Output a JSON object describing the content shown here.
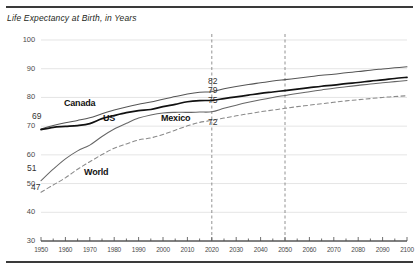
{
  "chart_data": {
    "type": "line",
    "title": "Life Expectancy at Birth, in Years",
    "xlabel": "",
    "ylabel": "",
    "xlim": [
      1950,
      2100
    ],
    "ylim": [
      30,
      100
    ],
    "ytick_step": 10,
    "xtick_step": 10,
    "xminor_step": 5,
    "grid": "horizontal",
    "legend": "inline-labels",
    "xticks": [
      "1950",
      "1960",
      "1970",
      "1980",
      "1990",
      "2000",
      "2010",
      "2020",
      "2030",
      "2040",
      "2050",
      "2060",
      "2070",
      "2080",
      "2090",
      "2100"
    ],
    "yticks": [
      "30",
      "40",
      "50",
      "60",
      "70",
      "80",
      "90",
      "100"
    ],
    "reference_lines": [
      {
        "name": "year-2020-marker",
        "x": 2020,
        "style": "dashed"
      },
      {
        "name": "year-2050-marker",
        "x": 2050,
        "style": "dashed"
      }
    ],
    "x": [
      1950,
      1955,
      1960,
      1965,
      1970,
      1975,
      1980,
      1985,
      1990,
      1995,
      2000,
      2005,
      2010,
      2015,
      2020,
      2025,
      2030,
      2035,
      2040,
      2045,
      2050,
      2055,
      2060,
      2065,
      2070,
      2075,
      2080,
      2085,
      2090,
      2095,
      2100
    ],
    "series": [
      {
        "name": "Canada",
        "color": "#555555",
        "style": "solid",
        "values": [
          69.0,
          70.2,
          71.2,
          72.0,
          72.9,
          74.3,
          75.6,
          76.7,
          77.6,
          78.4,
          79.4,
          80.3,
          81.2,
          81.8,
          82.0,
          83.0,
          83.8,
          84.5,
          85.1,
          85.7,
          86.2,
          86.7,
          87.2,
          87.7,
          88.1,
          88.6,
          89.0,
          89.5,
          89.9,
          90.3,
          90.7
        ]
      },
      {
        "name": "US",
        "color": "#111111",
        "style": "solid",
        "values": [
          68.8,
          69.6,
          69.9,
          70.2,
          70.9,
          72.6,
          73.7,
          74.7,
          75.4,
          75.8,
          76.8,
          77.6,
          78.5,
          78.9,
          79.0,
          79.6,
          80.2,
          80.8,
          81.4,
          81.9,
          82.4,
          82.9,
          83.4,
          83.9,
          84.3,
          84.8,
          85.2,
          85.7,
          86.1,
          86.6,
          87.0
        ]
      },
      {
        "name": "Mexico",
        "color": "#666666",
        "style": "solid",
        "values": [
          51.0,
          55.0,
          58.6,
          61.4,
          63.4,
          66.4,
          69.0,
          71.0,
          72.8,
          73.9,
          74.6,
          74.8,
          74.8,
          74.9,
          75.0,
          76.2,
          77.3,
          78.3,
          79.2,
          80.0,
          80.7,
          81.4,
          82.0,
          82.6,
          83.2,
          83.7,
          84.2,
          84.7,
          85.1,
          85.5,
          85.9
        ]
      },
      {
        "name": "World",
        "color": "#8a8a8a",
        "style": "dashed",
        "values": [
          47.0,
          49.5,
          52.0,
          55.0,
          57.6,
          60.1,
          62.3,
          63.8,
          65.2,
          65.9,
          67.1,
          68.6,
          70.1,
          71.3,
          72.0,
          72.8,
          73.6,
          74.3,
          75.0,
          75.6,
          76.2,
          76.8,
          77.3,
          77.8,
          78.3,
          78.8,
          79.2,
          79.6,
          80.0,
          80.3,
          80.6
        ]
      }
    ],
    "annotations": [
      {
        "name": "canada-start-value",
        "text": "69",
        "series": "Canada",
        "x": 1950,
        "value": 69
      },
      {
        "name": "mexico-start-value",
        "text": "51",
        "series": "Mexico",
        "x": 1950,
        "value": 51
      },
      {
        "name": "world-start-value",
        "text": "47",
        "series": "World",
        "x": 1950,
        "value": 47
      },
      {
        "name": "canada-2020-value",
        "text": "82",
        "series": "Canada",
        "x": 2020,
        "value": 82
      },
      {
        "name": "us-2020-value",
        "text": "79",
        "series": "US",
        "x": 2020,
        "value": 79
      },
      {
        "name": "mexico-2020-value",
        "text": "75",
        "series": "Mexico",
        "x": 2020,
        "value": 75
      },
      {
        "name": "world-2020-value",
        "text": "72",
        "series": "World",
        "x": 2020,
        "value": 72
      }
    ],
    "series_labels": [
      {
        "name": "Canada",
        "text": "Canada"
      },
      {
        "name": "US",
        "text": "US"
      },
      {
        "name": "Mexico",
        "text": "Mexico"
      },
      {
        "name": "World",
        "text": "World"
      }
    ]
  }
}
